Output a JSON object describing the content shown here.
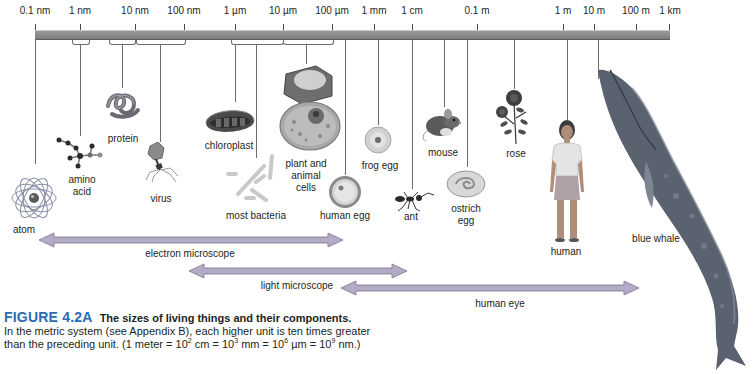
{
  "scale": {
    "ticks": [
      {
        "label": "0.1 nm",
        "x": 35
      },
      {
        "label": "1 nm",
        "x": 80
      },
      {
        "label": "10 nm",
        "x": 135
      },
      {
        "label": "100 nm",
        "x": 184
      },
      {
        "label": "1 µm",
        "x": 235
      },
      {
        "label": "10 µm",
        "x": 283
      },
      {
        "label": "100 µm",
        "x": 332
      },
      {
        "label": "1 mm",
        "x": 374
      },
      {
        "label": "1 cm",
        "x": 412
      },
      {
        "label": "0.1 m",
        "x": 477
      },
      {
        "label": "1 m",
        "x": 563
      },
      {
        "label": "10 m",
        "x": 594
      },
      {
        "label": "100 m",
        "x": 636
      },
      {
        "label": "1 km",
        "x": 670
      }
    ]
  },
  "objects": [
    {
      "label": "atom",
      "line_x": 35
    },
    {
      "label": "amino acid",
      "line1": "amino",
      "line2": "acid",
      "line_x": 80
    },
    {
      "label": "protein",
      "line_x": 122
    },
    {
      "label": "virus",
      "line_x": 160
    },
    {
      "label": "chloroplast",
      "line_x": 235
    },
    {
      "label": "most bacteria",
      "line_x": 256
    },
    {
      "label": "plant and animal cells",
      "line1": "plant and",
      "line2": "animal",
      "line3": "cells",
      "line_x": 306
    },
    {
      "label": "human egg",
      "line_x": 345
    },
    {
      "label": "frog egg",
      "line_x": 378
    },
    {
      "label": "ant",
      "line_x": 412
    },
    {
      "label": "mouse",
      "line_x": 444
    },
    {
      "label": "ostrich egg",
      "line1": "ostrich",
      "line2": "egg",
      "line_x": 467
    },
    {
      "label": "rose",
      "line_x": 514
    },
    {
      "label": "human",
      "line_x": 567
    },
    {
      "label": "blue whale",
      "line_x": 598
    }
  ],
  "ranges": [
    {
      "label": "electron microscope",
      "from": "0.1 nm",
      "to": "100 µm"
    },
    {
      "label": "light microscope",
      "from": "1 µm",
      "to": "1 cm"
    },
    {
      "label": "human eye",
      "from": "100 µm",
      "to": "10 m"
    }
  ],
  "caption": {
    "figure_label": "FIGURE 4.2A",
    "title": "The sizes of living things and their components.",
    "line1": "In the metric system (see Appendix B), each higher unit is ten times greater",
    "line2_pre": "than the preceding unit. (1 meter = 10",
    "sup1": "2",
    "line2_a": " cm = 10",
    "sup2": "3",
    "line2_b": " mm = 10",
    "sup3": "6",
    "line2_c": " µm = 10",
    "sup4": "9",
    "line2_d": " nm.)"
  },
  "colors": {
    "ruler": "#8a8a8a",
    "arrow_fill": "#b3aac6",
    "arrow_stroke": "#7d7390",
    "figure_label": "#2a6cb6"
  }
}
